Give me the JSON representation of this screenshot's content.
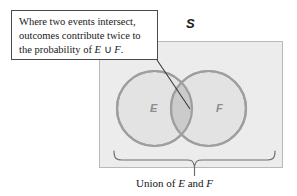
{
  "figure": {
    "title_label": "Venn diagram of the union of two events",
    "sample_space_label": "S",
    "callout": {
      "line1": "Where two events intersect,",
      "line2": "outcomes contribute twice to",
      "line3_prefix": "the probability of ",
      "line3_math_e": "E",
      "line3_union_symbol": " ∪ ",
      "line3_math_f": "F",
      "line3_suffix": "."
    },
    "circles": [
      {
        "label": "E",
        "name": "event-e"
      },
      {
        "label": "F",
        "name": "event-f"
      }
    ],
    "caption": {
      "prefix": "Union of ",
      "math_e": "E",
      "middle": " and ",
      "math_f": "F"
    },
    "colors": {
      "sample_space_fill": "#ececec",
      "sample_space_border": "#b9b9b9",
      "circle_fill": "#dedede",
      "circle_border": "#9e9e9e",
      "intersection_fill": "#cbcbcb",
      "label_gray": "#8d8d8d",
      "text_black": "#17171a",
      "leader_line": "#3a3a3a",
      "brace": "#6f6f6f"
    }
  }
}
